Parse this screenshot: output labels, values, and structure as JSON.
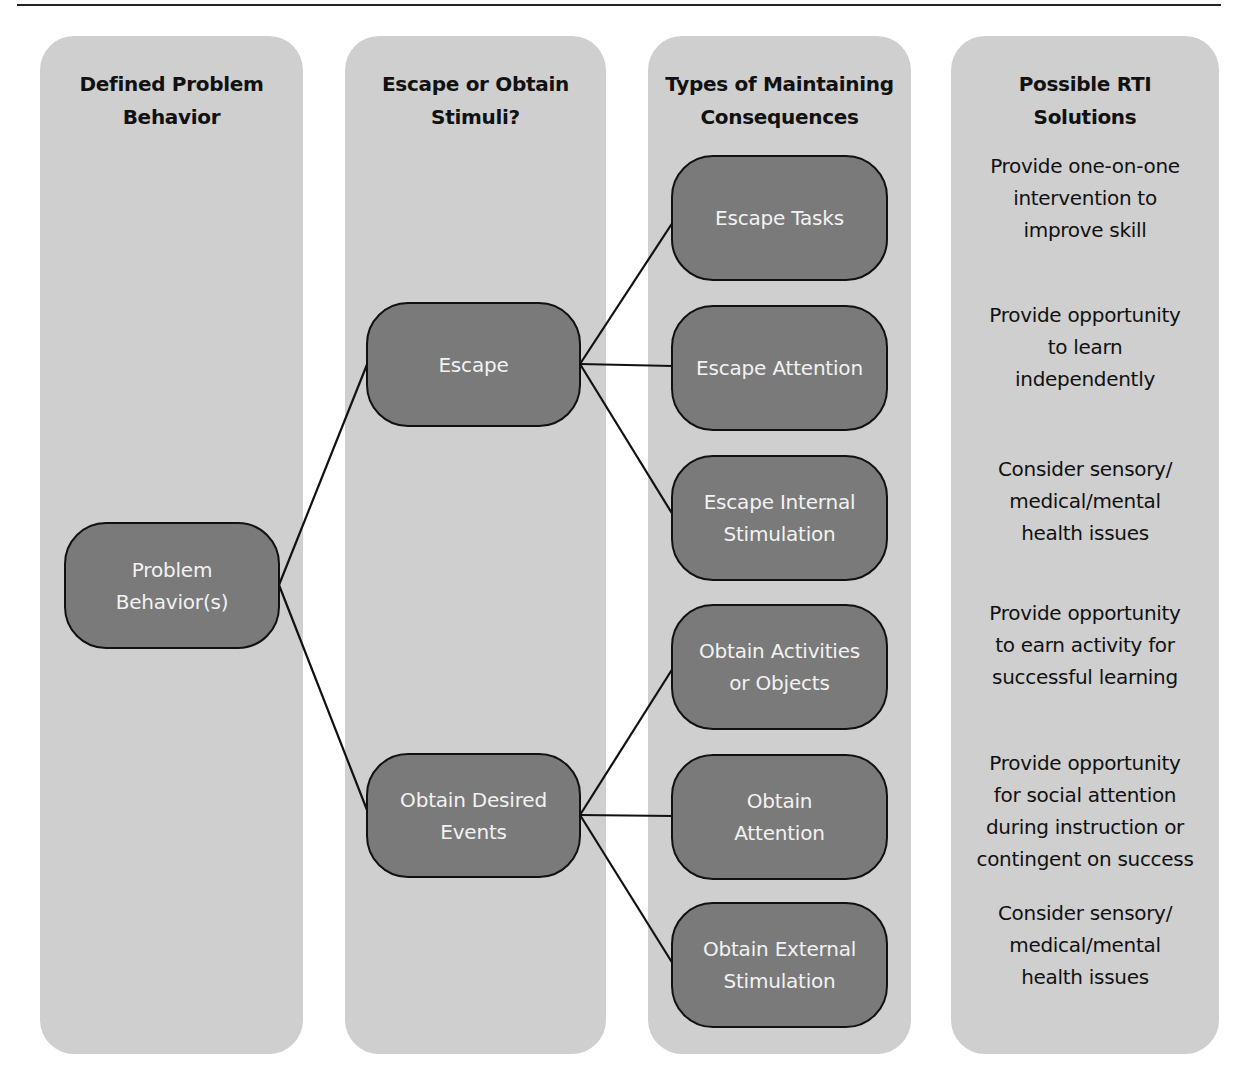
{
  "columns": [
    {
      "title": "Defined Problem\nBehavior"
    },
    {
      "title": "Escape or Obtain\nStimuli?"
    },
    {
      "title": "Types of Maintaining\nConsequences"
    },
    {
      "title": "Possible RTI\nSolutions"
    }
  ],
  "nodes": {
    "root": "Problem\nBehavior(s)",
    "escape": "Escape",
    "obtain": "Obtain Desired\nEvents",
    "escape_tasks": "Escape Tasks",
    "escape_attention": "Escape Attention",
    "escape_internal": "Escape Internal\nStimulation",
    "obtain_activities": "Obtain Activities\nor Objects",
    "obtain_attention": "Obtain\nAttention",
    "obtain_external": "Obtain External\nStimulation"
  },
  "solutions": [
    "Provide one-on-one\nintervention to\nimprove skill",
    "Provide opportunity\nto learn\nindependently",
    "Consider sensory/\nmedical/mental\nhealth issues",
    "Provide opportunity\nto earn activity for\nsuccessful learning",
    "Provide opportunity\nfor social attention\nduring instruction or\ncontingent on success",
    "Consider sensory/\nmedical/mental\nhealth issues"
  ],
  "colors": {
    "panel": "#cfcfcf",
    "node_fill": "#7a7a7a",
    "node_border": "#111111",
    "node_text": "#f2f2f2",
    "line": "#111111"
  }
}
